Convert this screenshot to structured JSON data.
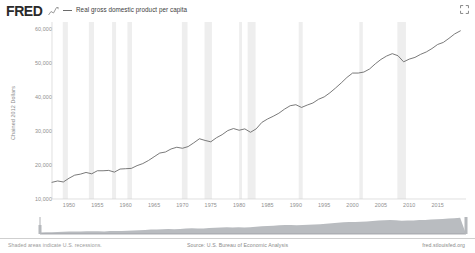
{
  "header": {
    "logo_text": "FRED",
    "spark_icon": "sparkline-icon",
    "expand_icon": "fullscreen-expand-icon",
    "legend": [
      {
        "label": "Real gross domestic product per capita",
        "color": "#6b6b6b"
      }
    ]
  },
  "footer": {
    "note": "Shaded areas indicate U.S. recessions.",
    "source": "Source: U.S. Bureau of Economic Analysis",
    "url": "fred.stlouisfed.org"
  },
  "colors": {
    "line": "#6b6b6b",
    "recession_band": "#eeeeee",
    "axis_text": "#8f8f8f",
    "slider_fill": "#b9bcc0",
    "background": "#ffffff"
  },
  "chart_data": {
    "type": "line",
    "title": "",
    "xlabel": "",
    "ylabel": "Chained 2012 Dollars",
    "xlim": [
      1947,
      2020
    ],
    "ylim": [
      10000,
      62000
    ],
    "grid": false,
    "legend_position": "top-left",
    "ytick_labels": [
      "60,000",
      "50,000",
      "40,000",
      "30,000",
      "20,000",
      "10,000"
    ],
    "ytick_values": [
      60000,
      50000,
      40000,
      30000,
      20000,
      10000
    ],
    "xtick_labels": [
      "1950",
      "1955",
      "1960",
      "1965",
      "1970",
      "1975",
      "1980",
      "1985",
      "1990",
      "1995",
      "2000",
      "2005",
      "2010",
      "2015"
    ],
    "xtick_values": [
      1950,
      1955,
      1960,
      1965,
      1970,
      1975,
      1980,
      1985,
      1990,
      1995,
      2000,
      2005,
      2010,
      2015
    ],
    "series": [
      {
        "name": "Real gross domestic product per capita",
        "units": "Chained 2012 Dollars",
        "x": [
          1947,
          1948,
          1949,
          1950,
          1951,
          1952,
          1953,
          1954,
          1955,
          1956,
          1957,
          1958,
          1959,
          1960,
          1961,
          1962,
          1963,
          1964,
          1965,
          1966,
          1967,
          1968,
          1969,
          1970,
          1971,
          1972,
          1973,
          1974,
          1975,
          1976,
          1977,
          1978,
          1979,
          1980,
          1981,
          1982,
          1983,
          1984,
          1985,
          1986,
          1987,
          1988,
          1989,
          1990,
          1991,
          1992,
          1993,
          1994,
          1995,
          1996,
          1997,
          1998,
          1999,
          2000,
          2001,
          2002,
          2003,
          2004,
          2005,
          2006,
          2007,
          2008,
          2009,
          2010,
          2011,
          2012,
          2013,
          2014,
          2015,
          2016,
          2017,
          2018,
          2019
        ],
        "y": [
          14900,
          15300,
          15000,
          16100,
          17000,
          17300,
          17800,
          17400,
          18300,
          18300,
          18400,
          17900,
          18800,
          18900,
          19000,
          19800,
          20400,
          21300,
          22400,
          23500,
          23800,
          24700,
          25200,
          24900,
          25400,
          26500,
          27700,
          27200,
          26800,
          28000,
          28900,
          30100,
          30700,
          30200,
          30600,
          29600,
          30600,
          32500,
          33500,
          34300,
          35200,
          36400,
          37400,
          37700,
          36900,
          37600,
          38200,
          39300,
          40000,
          41200,
          42600,
          44100,
          45700,
          47000,
          47000,
          47300,
          48200,
          49700,
          51000,
          52000,
          52700,
          52100,
          50300,
          51100,
          51600,
          52500,
          53200,
          54200,
          55400,
          56000,
          57200,
          58500,
          59400
        ]
      }
    ],
    "annotations": [
      {
        "type": "recession_band",
        "start": 1948.9,
        "end": 1949.8
      },
      {
        "type": "recession_band",
        "start": 1953.5,
        "end": 1954.4
      },
      {
        "type": "recession_band",
        "start": 1957.6,
        "end": 1958.3
      },
      {
        "type": "recession_band",
        "start": 1960.3,
        "end": 1961.1
      },
      {
        "type": "recession_band",
        "start": 1969.9,
        "end": 1970.9
      },
      {
        "type": "recession_band",
        "start": 1973.9,
        "end": 1975.2
      },
      {
        "type": "recession_band",
        "start": 1980.0,
        "end": 1980.5
      },
      {
        "type": "recession_band",
        "start": 1981.5,
        "end": 1982.9
      },
      {
        "type": "recession_band",
        "start": 1990.5,
        "end": 1991.2
      },
      {
        "type": "recession_band",
        "start": 2001.2,
        "end": 2001.8
      },
      {
        "type": "recession_band",
        "start": 2007.9,
        "end": 2009.4
      }
    ]
  },
  "range_slider": {
    "label": "chart-range-slider",
    "start_handle": "range-start-handle",
    "end_handle": "range-end-handle"
  }
}
